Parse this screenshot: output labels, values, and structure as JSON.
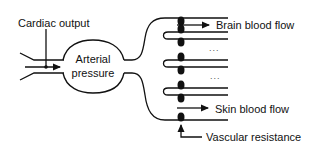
{
  "diagram": {
    "labels": {
      "cardiac_output": "Cardiac output",
      "arterial_line1": "Arterial",
      "arterial_line2": "pressure",
      "brain_flow": "Brain blood flow",
      "ellipsis_1": "...",
      "ellipsis_2": "...",
      "skin_flow": "Skin blood flow",
      "vascular_resistance": "Vascular resistance"
    },
    "nodes": [
      {
        "id": "cardiac_output",
        "label": "Cardiac output",
        "type": "input"
      },
      {
        "id": "arterial_pressure",
        "label": "Arterial pressure",
        "type": "reservoir"
      },
      {
        "id": "brain_flow",
        "label": "Brain blood flow",
        "type": "output"
      },
      {
        "id": "other_flow_1",
        "label": "...",
        "type": "output"
      },
      {
        "id": "other_flow_2",
        "label": "...",
        "type": "output"
      },
      {
        "id": "skin_flow",
        "label": "Skin blood flow",
        "type": "output"
      },
      {
        "id": "vascular_resistance",
        "label": "Vascular resistance",
        "type": "control"
      }
    ],
    "edges": [
      {
        "from": "cardiac_output",
        "to": "arterial_pressure"
      },
      {
        "from": "arterial_pressure",
        "to": "brain_flow"
      },
      {
        "from": "arterial_pressure",
        "to": "other_flow_1"
      },
      {
        "from": "arterial_pressure",
        "to": "other_flow_2"
      },
      {
        "from": "arterial_pressure",
        "to": "skin_flow"
      },
      {
        "from": "vascular_resistance",
        "to": "skin_flow"
      }
    ],
    "colors": {
      "stroke": "#111111",
      "background": "#ffffff"
    }
  }
}
